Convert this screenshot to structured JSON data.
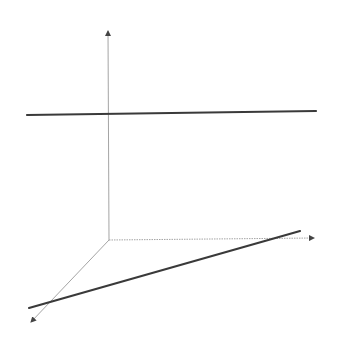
{
  "diagram": {
    "title": "",
    "colors": {
      "background": "#ffffff",
      "axis": "#9a9a9a",
      "line": "#3a3a3a",
      "arrow": "#444444"
    },
    "origin": {
      "x": 109,
      "y": 240
    },
    "axes": [
      {
        "name": "z-axis",
        "direction": "up",
        "from": {
          "x": 109,
          "y": 240
        },
        "to": {
          "x": 108,
          "y": 31
        },
        "style": "solid"
      },
      {
        "name": "y-axis",
        "direction": "right",
        "from": {
          "x": 109,
          "y": 240
        },
        "to": {
          "x": 314,
          "y": 238
        },
        "style": "dotted"
      },
      {
        "name": "x-axis",
        "direction": "down-left",
        "from": {
          "x": 109,
          "y": 240
        },
        "to": {
          "x": 31,
          "y": 322
        },
        "style": "solid"
      }
    ],
    "lines": [
      {
        "name": "upper-line",
        "from": {
          "x": 27,
          "y": 115
        },
        "to": {
          "x": 316,
          "y": 111
        }
      },
      {
        "name": "lower-line",
        "from": {
          "x": 29,
          "y": 308
        },
        "to": {
          "x": 300,
          "y": 231
        }
      }
    ]
  }
}
